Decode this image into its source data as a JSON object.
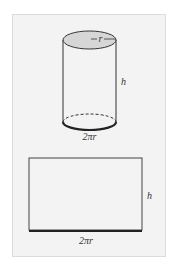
{
  "figure": {
    "cylinder": {
      "radius_label": "r",
      "height_label": "h",
      "circumference_label": "2πr",
      "top_fill": "#d6d6d6",
      "stroke": "#333333"
    },
    "rectangle": {
      "height_label": "h",
      "width_label": "2πr",
      "stroke": "#333333"
    },
    "background": "#f3f3f3"
  }
}
